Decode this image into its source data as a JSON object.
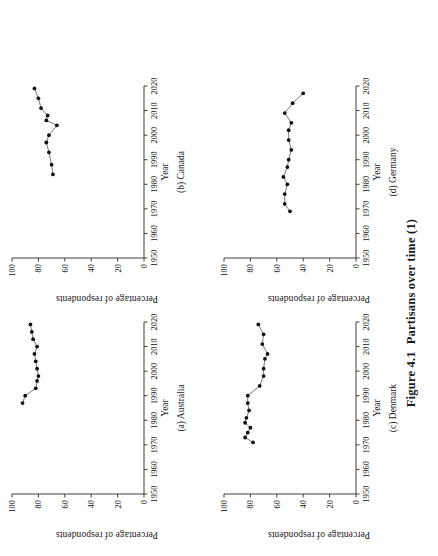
{
  "figure": {
    "number": "Figure 4.1",
    "caption": "Partisans over time (1)"
  },
  "axis": {
    "x_title": "Year",
    "y_title": "Percentage of respondents",
    "x_ticks": [
      "1950",
      "1960",
      "1970",
      "1980",
      "1990",
      "2000",
      "2010",
      "2020"
    ],
    "y_ticks": [
      "0",
      "20",
      "40",
      "60",
      "80",
      "100"
    ]
  },
  "chart_data": [
    {
      "type": "line",
      "title": "(a) Australia",
      "panel_letter": "(a)",
      "country": "Australia",
      "xlabel": "Year",
      "ylabel": "Percentage of respondents",
      "xlim": [
        1950,
        2020
      ],
      "ylim": [
        0,
        100
      ],
      "grid": false,
      "legend": "none",
      "x": [
        1987,
        1990,
        1993,
        1996,
        1998,
        2001,
        2004,
        2007,
        2010,
        2013,
        2016,
        2019
      ],
      "y": [
        92,
        90,
        82,
        81,
        80,
        81,
        82,
        83,
        81,
        84,
        85,
        86
      ]
    },
    {
      "type": "line",
      "title": "(b) Canada",
      "panel_letter": "(b)",
      "country": "Canada",
      "xlabel": "Year",
      "ylabel": "Percentage of respondents",
      "xlim": [
        1950,
        2020
      ],
      "ylim": [
        0,
        100
      ],
      "grid": false,
      "legend": "none",
      "x": [
        1984,
        1988,
        1993,
        1997,
        2000,
        2004,
        2006,
        2008,
        2011,
        2015,
        2019
      ],
      "y": [
        69,
        70,
        72,
        74,
        72,
        66,
        74,
        73,
        78,
        80,
        83
      ]
    },
    {
      "type": "line",
      "title": "(c) Denmark",
      "panel_letter": "(c)",
      "country": "Denmark",
      "xlabel": "Year",
      "ylabel": "Percentage of respondents",
      "xlim": [
        1950,
        2020
      ],
      "ylim": [
        0,
        100
      ],
      "grid": false,
      "legend": "none",
      "x": [
        1971,
        1973,
        1975,
        1977,
        1979,
        1981,
        1984,
        1987,
        1990,
        1994,
        1998,
        2001,
        2005,
        2007,
        2011,
        2015,
        2019
      ],
      "y": [
        78,
        84,
        82,
        80,
        84,
        83,
        81,
        82,
        82,
        73,
        70,
        70,
        69,
        67,
        71,
        70,
        74
      ]
    },
    {
      "type": "line",
      "title": "(d) Germany",
      "panel_letter": "(d)",
      "country": "Germany",
      "xlabel": "Year",
      "ylabel": "Percentage of respondents",
      "xlim": [
        1950,
        2020
      ],
      "ylim": [
        0,
        100
      ],
      "grid": false,
      "legend": "none",
      "x": [
        1969,
        1972,
        1976,
        1980,
        1983,
        1987,
        1990,
        1994,
        1998,
        2002,
        2005,
        2009,
        2013,
        2017
      ],
      "y": [
        50,
        54,
        54,
        52,
        55,
        52,
        51,
        49,
        51,
        51,
        49,
        54,
        48,
        40
      ]
    }
  ]
}
